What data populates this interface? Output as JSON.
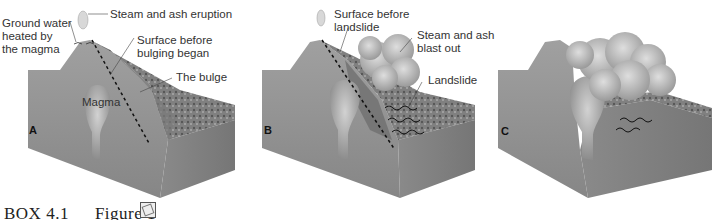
{
  "figure": {
    "panels": [
      {
        "letter": "A",
        "labels": {
          "eruption": "Steam and ash eruption",
          "groundwater": "Ground water\nheated  by\nthe magma",
          "groundwater_l1": "Ground water",
          "groundwater_l2": "heated  by",
          "groundwater_l3": "the magma",
          "surface_l1": "Surface before",
          "surface_l2": "bulging began",
          "bulge": "The bulge",
          "magma": "Magma"
        }
      },
      {
        "letter": "B",
        "labels": {
          "surface_l1": "Surface before",
          "surface_l2": "landslide",
          "blast_l1": "Steam and ash",
          "blast_l2": "blast out",
          "landslide": "Landslide"
        }
      },
      {
        "letter": "C",
        "labels": {}
      }
    ],
    "caption": {
      "box": "BOX 4.1",
      "figure": "Figure 1",
      "icon": "figure-link-icon"
    },
    "colors": {
      "block_front": "#8f8f8f",
      "block_side": "#7d7d7d",
      "block_top": "#9a9a9a",
      "magma": "#b4b4b4",
      "cloud": "#c8c8c8",
      "slide": "#5e5e5e",
      "background": "#ffffff"
    }
  }
}
